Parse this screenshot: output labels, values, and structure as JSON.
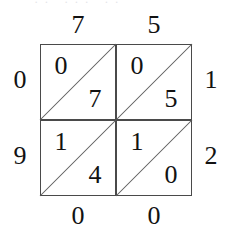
{
  "figure": {
    "type": "lattice-multiplication-grid",
    "rows": 2,
    "columns": 2,
    "top_labels": [
      "7",
      "5"
    ],
    "right_labels": [
      "1",
      "2"
    ],
    "bottom_labels": [
      "0",
      "0"
    ],
    "left_labels": [
      "0",
      "9"
    ],
    "diagonal_direction": "bottom-left-to-top-right",
    "cells": [
      {
        "position": "top-left",
        "row": 0,
        "col": 0,
        "upper_digit": "0",
        "lower_digit": "7"
      },
      {
        "position": "top-right",
        "row": 0,
        "col": 1,
        "upper_digit": "0",
        "lower_digit": "5"
      },
      {
        "position": "bottom-left",
        "row": 1,
        "col": 0,
        "upper_digit": "1",
        "lower_digit": "4"
      },
      {
        "position": "bottom-right",
        "row": 1,
        "col": 1,
        "upper_digit": "1",
        "lower_digit": "0"
      }
    ],
    "clipped_top_text": "·· ··· ··",
    "colors": {
      "background": "#ffffff",
      "grid_line": "#4a4a4a",
      "diagonal_line": "#5a5a5a",
      "digit": "#121212"
    }
  }
}
